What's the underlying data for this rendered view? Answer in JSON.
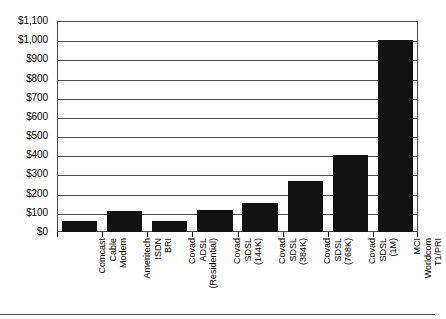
{
  "chart_data": {
    "type": "bar",
    "title": "",
    "xlabel": "",
    "ylabel": "",
    "ylim": [
      0,
      1100
    ],
    "ytick_step": 100,
    "grid": true,
    "legend": "none",
    "bar_color": "#121212",
    "axis_color": "#4d4d4d",
    "categories": [
      "Comcast Cable Modem",
      "Ameritech ISDN BRI",
      "Covad ADSL (Residential)",
      "Covad SDSL (144K)",
      "Covad SDSL (384K)",
      "Covad SDSL (768K)",
      "Covad SDSL (1M)",
      "MCI Worldcom T1/PRI"
    ],
    "category_lines": [
      [
        "Comcast",
        "Cable",
        "Modem"
      ],
      [
        "Ameritech",
        "ISDN",
        "BRI"
      ],
      [
        "Covad",
        "ADSL",
        "(Residential)"
      ],
      [
        "Covad",
        "SDSL",
        "(144K)"
      ],
      [
        "Covad",
        "SDSL",
        "(384K)"
      ],
      [
        "Covad",
        "SDSL",
        "(768K)"
      ],
      [
        "Covad",
        "SDSL",
        "(1M)"
      ],
      [
        "MCI",
        "Worldcom",
        "T1/PRI"
      ]
    ],
    "values": [
      57,
      110,
      55,
      115,
      150,
      265,
      400,
      1000
    ],
    "ytick_labels": [
      "$1,100",
      "$1,000",
      "$900",
      "$800",
      "$700",
      "$600",
      "$500",
      "$400",
      "$300",
      "$200",
      "$100",
      "$0"
    ],
    "ytick_values": [
      1100,
      1000,
      900,
      800,
      700,
      600,
      500,
      400,
      300,
      200,
      100,
      0
    ]
  }
}
